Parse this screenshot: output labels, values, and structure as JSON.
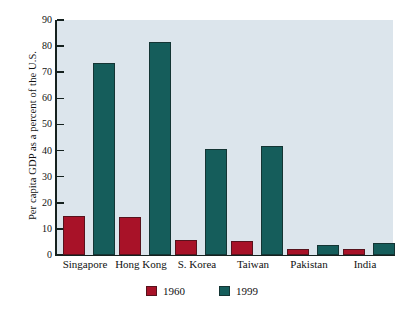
{
  "chart_data": {
    "type": "bar",
    "title": "",
    "subtitle": "",
    "xlabel": "",
    "ylabel": "Per capita GDP as a percent of the U.S.",
    "categories": [
      "Singapore",
      "Hong Kong",
      "S. Korea",
      "Taiwan",
      "Pakistan",
      "India"
    ],
    "series": [
      {
        "name": "1960",
        "color": "#a81228",
        "values": [
          15,
          14.7,
          5.6,
          5.2,
          2.2,
          2.2
        ]
      },
      {
        "name": "1999",
        "color": "#155d5b",
        "values": [
          73.5,
          81.5,
          40.5,
          41.7,
          3.8,
          4.5
        ]
      }
    ],
    "ylim": [
      0,
      90
    ],
    "ytick_step": 10,
    "yticks": [
      90,
      80,
      70,
      60,
      50,
      40,
      30,
      20,
      10,
      0
    ],
    "ytick_labels": [
      "90",
      "80",
      "70",
      "60",
      "50",
      "40",
      "30",
      "20",
      "10",
      "0"
    ],
    "grid": false,
    "legend_position": "bottom-center",
    "legend_entries": [
      "1960",
      "1999"
    ],
    "plot_background": "#dce5ec",
    "axis_color": "#15211f",
    "figure_background": "#ffffff"
  }
}
